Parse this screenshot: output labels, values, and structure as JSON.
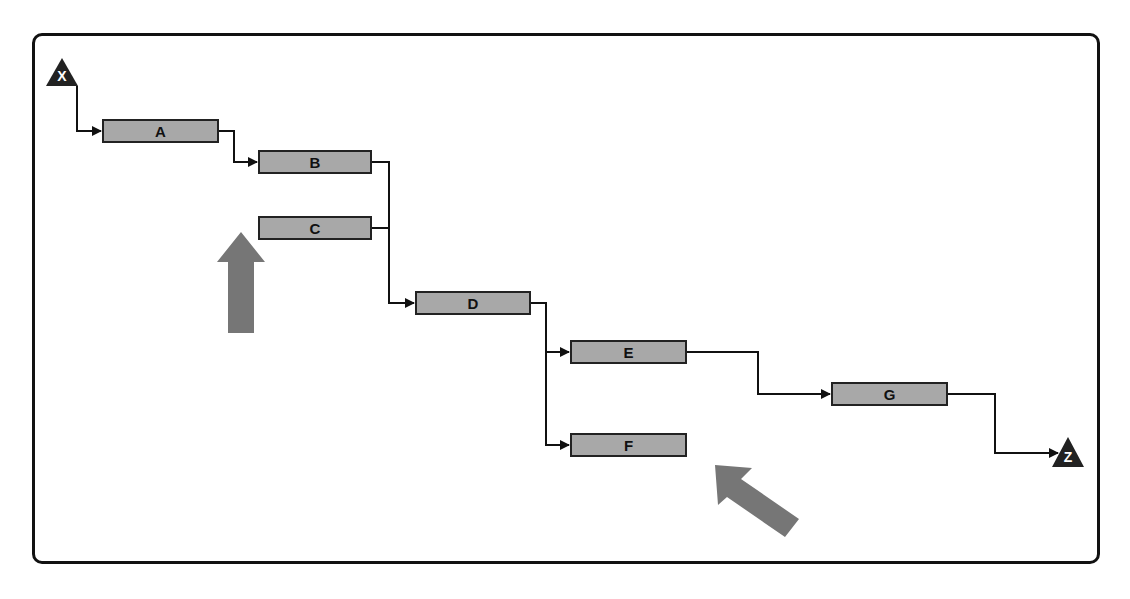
{
  "diagram": {
    "type": "precedence-network",
    "start": {
      "label": "X",
      "shape": "triangle",
      "fill": "#222222"
    },
    "end": {
      "label": "Z",
      "shape": "triangle",
      "fill": "#222222"
    },
    "nodes": [
      {
        "id": "A",
        "label": "A"
      },
      {
        "id": "B",
        "label": "B"
      },
      {
        "id": "C",
        "label": "C"
      },
      {
        "id": "D",
        "label": "D"
      },
      {
        "id": "E",
        "label": "E"
      },
      {
        "id": "F",
        "label": "F"
      },
      {
        "id": "G",
        "label": "G"
      }
    ],
    "edges": [
      {
        "from": "X",
        "to": "A"
      },
      {
        "from": "A",
        "to": "B"
      },
      {
        "from": "B",
        "to": "D"
      },
      {
        "from": "C",
        "to": "D"
      },
      {
        "from": "D",
        "to": "E"
      },
      {
        "from": "D",
        "to": "F"
      },
      {
        "from": "E",
        "to": "G"
      },
      {
        "from": "G",
        "to": "Z"
      }
    ],
    "callouts": [
      {
        "name": "up-arrow",
        "points_to": "C",
        "color": "#767676"
      },
      {
        "name": "diagonal-arrow",
        "points_to": "F",
        "color": "#767676"
      }
    ],
    "colors": {
      "node_fill": "#a8a8a8",
      "stroke": "#222222",
      "callout": "#767676"
    }
  }
}
